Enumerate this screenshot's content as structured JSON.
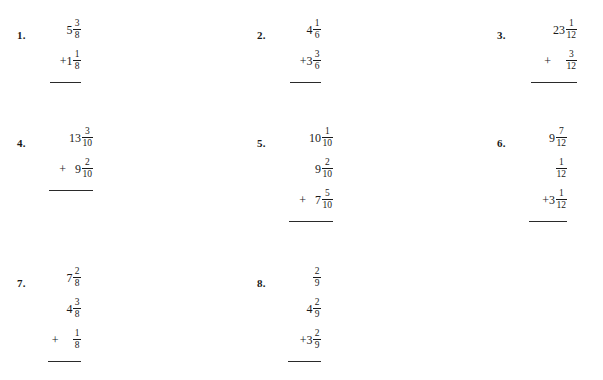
{
  "page": {
    "background": "#ffffff",
    "ink": "#1a1a1a",
    "topic": "Adding Mixed Numbers with Like Denominators"
  },
  "columns": {
    "count": 3,
    "x_positions": [
      17,
      257,
      497
    ]
  },
  "rows": {
    "count": 3,
    "y_positions": [
      14,
      122,
      262
    ]
  },
  "problems": [
    {
      "number": "1.",
      "column": 0,
      "row": 0,
      "stack_width": 42,
      "rule_width": 31,
      "terms": [
        {
          "operator": "",
          "operator_style": "none",
          "whole": "5",
          "numerator": "3",
          "denominator": "8"
        },
        {
          "operator": "+",
          "operator_style": "tight",
          "whole": "1",
          "numerator": "1",
          "denominator": "8"
        }
      ]
    },
    {
      "number": "2.",
      "column": 1,
      "row": 0,
      "stack_width": 42,
      "rule_width": 31,
      "terms": [
        {
          "operator": "",
          "operator_style": "none",
          "whole": "4",
          "numerator": "1",
          "denominator": "6"
        },
        {
          "operator": "+",
          "operator_style": "tight",
          "whole": "3",
          "numerator": "3",
          "denominator": "6"
        }
      ]
    },
    {
      "number": "3.",
      "column": 2,
      "row": 0,
      "stack_width": 58,
      "rule_width": 46,
      "terms": [
        {
          "operator": "",
          "operator_style": "none",
          "whole": "23",
          "numerator": "1",
          "denominator": "12"
        },
        {
          "operator": "+",
          "operator_style": "wide",
          "whole": "",
          "numerator": "3",
          "denominator": "12"
        }
      ]
    },
    {
      "number": "4.",
      "column": 0,
      "row": 1,
      "stack_width": 54,
      "rule_width": 44,
      "terms": [
        {
          "operator": "",
          "operator_style": "none",
          "whole": "13",
          "numerator": "3",
          "denominator": "10"
        },
        {
          "operator": "+",
          "operator_style": "spaced",
          "whole": "9",
          "numerator": "2",
          "denominator": "10"
        }
      ]
    },
    {
      "number": "5.",
      "column": 1,
      "row": 1,
      "stack_width": 54,
      "rule_width": 44,
      "terms": [
        {
          "operator": "",
          "operator_style": "none",
          "whole": "10",
          "numerator": "1",
          "denominator": "10"
        },
        {
          "operator": "",
          "operator_style": "none",
          "whole": "9",
          "numerator": "2",
          "denominator": "10"
        },
        {
          "operator": "+",
          "operator_style": "spaced",
          "whole": "7",
          "numerator": "5",
          "denominator": "10"
        }
      ]
    },
    {
      "number": "6.",
      "column": 2,
      "row": 1,
      "stack_width": 48,
      "rule_width": 38,
      "terms": [
        {
          "operator": "",
          "operator_style": "none",
          "whole": "9",
          "numerator": "7",
          "denominator": "12"
        },
        {
          "operator": "",
          "operator_style": "none",
          "whole": "",
          "numerator": "1",
          "denominator": "12"
        },
        {
          "operator": "+",
          "operator_style": "tight",
          "whole": "3",
          "numerator": "1",
          "denominator": "12"
        }
      ]
    },
    {
      "number": "7.",
      "column": 0,
      "row": 2,
      "stack_width": 42,
      "rule_width": 33,
      "terms": [
        {
          "operator": "",
          "operator_style": "none",
          "whole": "7",
          "numerator": "2",
          "denominator": "8"
        },
        {
          "operator": "",
          "operator_style": "none",
          "whole": "4",
          "numerator": "3",
          "denominator": "8"
        },
        {
          "operator": "+",
          "operator_style": "wide",
          "whole": "",
          "numerator": "1",
          "denominator": "8"
        }
      ]
    },
    {
      "number": "8.",
      "column": 1,
      "row": 2,
      "stack_width": 42,
      "rule_width": 33,
      "terms": [
        {
          "operator": "",
          "operator_style": "none",
          "whole": "",
          "numerator": "2",
          "denominator": "9"
        },
        {
          "operator": "",
          "operator_style": "none",
          "whole": "4",
          "numerator": "2",
          "denominator": "9"
        },
        {
          "operator": "+",
          "operator_style": "tight",
          "whole": "3",
          "numerator": "2",
          "denominator": "9"
        }
      ]
    }
  ]
}
